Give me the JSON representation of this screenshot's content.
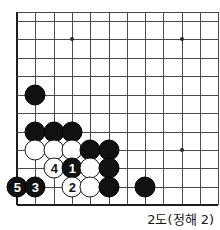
{
  "figure": {
    "caption": "2도(정해 2)",
    "colors": {
      "black_stone": "#111111",
      "white_stone": "#ffffff",
      "grid_line": "#4a4a4a",
      "board_edge": "#1c1c1c",
      "background": "#ffffff"
    }
  },
  "board": {
    "grid": {
      "columns_x": [
        17,
        35,
        54,
        72,
        90,
        109,
        127,
        145,
        163,
        182,
        200,
        218
      ],
      "rows_y": [
        12,
        21,
        39,
        58,
        76,
        95,
        113,
        132,
        150,
        168,
        187,
        205
      ],
      "left_edge_x": 17,
      "bottom_edge_y": 205,
      "top_edge_y": 12
    },
    "star_points": [
      {
        "x": 72,
        "y": 39
      },
      {
        "x": 182,
        "y": 39
      },
      {
        "x": 182,
        "y": 150
      }
    ],
    "stones": [
      {
        "color": "black",
        "x": 35,
        "y": 95,
        "label": ""
      },
      {
        "color": "black",
        "x": 35,
        "y": 132,
        "label": ""
      },
      {
        "color": "black",
        "x": 54,
        "y": 132,
        "label": ""
      },
      {
        "color": "black",
        "x": 72,
        "y": 132,
        "label": ""
      },
      {
        "color": "white",
        "x": 35,
        "y": 150,
        "label": ""
      },
      {
        "color": "white",
        "x": 54,
        "y": 150,
        "label": ""
      },
      {
        "color": "white",
        "x": 72,
        "y": 150,
        "label": ""
      },
      {
        "color": "black",
        "x": 90,
        "y": 150,
        "label": ""
      },
      {
        "color": "black",
        "x": 109,
        "y": 150,
        "label": ""
      },
      {
        "color": "white",
        "x": 54,
        "y": 168,
        "label": "4"
      },
      {
        "color": "black",
        "x": 72,
        "y": 168,
        "label": "1"
      },
      {
        "color": "white",
        "x": 90,
        "y": 168,
        "label": ""
      },
      {
        "color": "black",
        "x": 109,
        "y": 168,
        "label": ""
      },
      {
        "color": "black",
        "x": 17,
        "y": 187,
        "label": "5"
      },
      {
        "color": "black",
        "x": 35,
        "y": 187,
        "label": "3"
      },
      {
        "color": "white",
        "x": 72,
        "y": 187,
        "label": "2"
      },
      {
        "color": "white",
        "x": 90,
        "y": 187,
        "label": ""
      },
      {
        "color": "black",
        "x": 109,
        "y": 187,
        "label": ""
      },
      {
        "color": "black",
        "x": 145,
        "y": 187,
        "label": ""
      }
    ]
  }
}
